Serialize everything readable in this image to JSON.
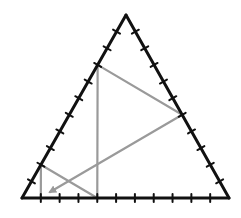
{
  "diagram": {
    "triangle": {
      "vertices": [
        "top",
        "bottom-left",
        "bottom-right"
      ],
      "divisions_per_side": 11,
      "stroke_color": "#111111"
    },
    "path": {
      "color": "#9a9a9a",
      "points_barycentric_note": "positions as fractions along sides (segment index out of 11)",
      "sequence": [
        {
          "side": "bottom",
          "from_left_segments": 4
        },
        {
          "side": "left",
          "from_bottom_segments": 8
        },
        {
          "side": "right",
          "from_bottom_segments": 5
        },
        {
          "end": "arrow",
          "near": "bottom-left"
        }
      ],
      "extra_segments": [
        {
          "from": {
            "side": "bottom",
            "from_left_segments": 4
          },
          "to": {
            "side": "left",
            "from_bottom_segments": 2
          }
        },
        {
          "from": {
            "side": "left",
            "from_bottom_segments": 2
          },
          "to": {
            "side": "bottom",
            "from_left_segments": 1
          }
        }
      ]
    }
  }
}
